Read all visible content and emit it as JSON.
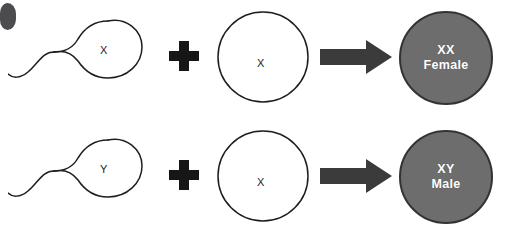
{
  "diagram": {
    "background_color": "#ffffff",
    "outline_color": "#1e1e1e",
    "zygote_fill_color": "#6d6d6d",
    "zygote_stroke_color": "#333333",
    "zygote_text_color": "#ffffff",
    "arrow_color": "#3b3b3b",
    "plus_color": "#161616",
    "corner_mark_color": "#3f3f41",
    "rows": [
      {
        "id": "female",
        "sperm": {
          "label": "X",
          "name": "sperm-x"
        },
        "operator": "+",
        "egg": {
          "label": "X",
          "name": "egg-x"
        },
        "arrow": "→",
        "zygote": {
          "genotype": "XX",
          "sex": "Female"
        }
      },
      {
        "id": "male",
        "sperm": {
          "label": "Y",
          "name": "sperm-y"
        },
        "operator": "+",
        "egg": {
          "label": "X",
          "name": "egg-x"
        },
        "arrow": "→",
        "zygote": {
          "genotype": "XY",
          "sex": "Male"
        }
      }
    ]
  }
}
